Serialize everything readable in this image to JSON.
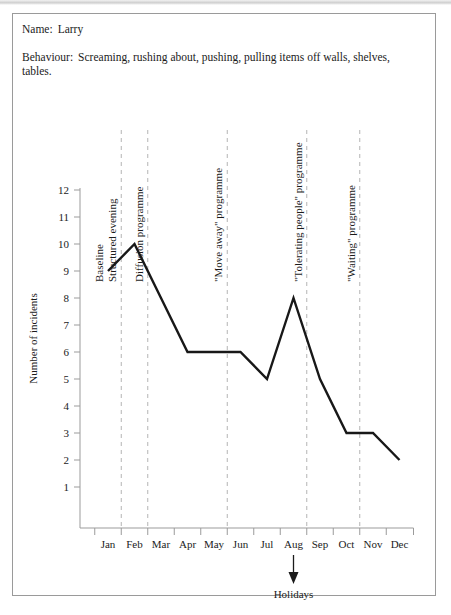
{
  "document": {
    "name_label": "Name:",
    "name_value": "Larry",
    "behaviour_label": "Behaviour:",
    "behaviour_value": "Screaming, rushing about, pushing, pulling items off walls, shelves, tables."
  },
  "chart_data": {
    "type": "line",
    "title": "",
    "xlabel": "",
    "ylabel": "Number of incidents",
    "categories": [
      "Jan",
      "Feb",
      "Mar",
      "Apr",
      "May",
      "Jun",
      "Jul",
      "Aug",
      "Sep",
      "Oct",
      "Nov",
      "Dec"
    ],
    "values": [
      9,
      10,
      8,
      6,
      6,
      6,
      5,
      8,
      5,
      3,
      3,
      2
    ],
    "series": [
      {
        "name": "Number of incidents",
        "values": [
          9,
          10,
          8,
          6,
          6,
          6,
          5,
          8,
          5,
          3,
          3,
          2
        ]
      }
    ],
    "ylim": [
      0,
      12
    ],
    "yticks": [
      1,
      2,
      3,
      4,
      5,
      6,
      7,
      8,
      9,
      10,
      11,
      12
    ],
    "ytick_labels": [
      "1",
      "2",
      "3",
      "4",
      "5",
      "6",
      "7",
      "8",
      "9",
      "10",
      "11",
      "12"
    ],
    "grid": false,
    "legend": "none",
    "phase_labels": [
      {
        "label": "Baseline",
        "at_month": "Jan",
        "has_line": false
      },
      {
        "label": "Structured evening",
        "at_month": "Feb",
        "has_line": true
      },
      {
        "label": "Diffusion programme",
        "at_month": "Mar",
        "has_line": true
      },
      {
        "label": "\"Move away\" programme",
        "at_month": "Jun",
        "has_line": true
      },
      {
        "label": "\"Tolerating people\" programme",
        "at_month": "Sep",
        "has_line": true
      },
      {
        "label": "\"Waiting\" programme",
        "at_month": "Nov",
        "has_line": true
      }
    ],
    "annotations": [
      {
        "label": "Holidays",
        "at_month": "Aug",
        "marker": "down-arrow"
      }
    ]
  }
}
